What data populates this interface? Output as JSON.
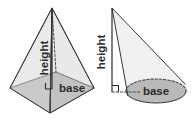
{
  "canvas": {
    "width": 196,
    "height": 118,
    "background": "#ffffff"
  },
  "palette": {
    "stroke": "#3a3a3a",
    "stroke_light": "#6b6b6b",
    "dashed_stroke": "#555555",
    "base_fill": "#b9b9b9",
    "face_fill": "#d6d6d6",
    "face_fill_dark": "#c4c4c4",
    "text": "#2b2b2b"
  },
  "figures": [
    {
      "id": "pyramid",
      "name": "square-pyramid",
      "shape_type": "square pyramid",
      "apex": {
        "x": 52,
        "y": 8
      },
      "base_center": {
        "x": 52,
        "y": 88
      },
      "base_vertices": [
        {
          "x": 10,
          "y": 88
        },
        {
          "x": 50,
          "y": 113
        },
        {
          "x": 94,
          "y": 88
        },
        {
          "x": 56,
          "y": 72
        }
      ],
      "hidden_edges": [
        "back-left base edge",
        "back-right base edge",
        "apex to back vertex"
      ],
      "labels": {
        "height": "height",
        "base": "base"
      },
      "height_label_rotation_deg": -90,
      "right_angle_marker": true
    },
    {
      "id": "cone",
      "name": "cone",
      "shape_type": "cone",
      "apex": {
        "x": 112,
        "y": 8
      },
      "base_center": {
        "x": 156,
        "y": 91
      },
      "base_ellipse": {
        "cx": 156,
        "cy": 91,
        "rx": 30,
        "ry": 12
      },
      "height_foot": {
        "x": 112,
        "y": 91
      },
      "hidden_edges": [
        "back arc of base ellipse",
        "radius from foot to center"
      ],
      "labels": {
        "height": "height",
        "base": "base"
      },
      "height_label_rotation_deg": -90,
      "right_angle_marker": true
    }
  ]
}
